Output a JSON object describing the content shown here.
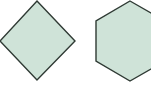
{
  "canvas": {
    "width": 151,
    "height": 85,
    "background": "#ffffff"
  },
  "style": {
    "fill": "#cfe3d8",
    "stroke": "#2f3a34",
    "stroke_width": 1.4
  },
  "shapes": [
    {
      "name": "diamond",
      "points": "37,1 75,41 37,80 0,41"
    },
    {
      "name": "hexagon",
      "points": "130,1 165,21 165,61 130,81 96,61 96,21"
    }
  ]
}
